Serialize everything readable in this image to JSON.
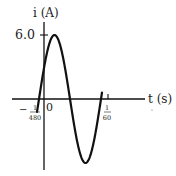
{
  "chart_data": {
    "type": "line",
    "title": "",
    "xlabel": "t (s)",
    "ylabel": "i (A)",
    "function": "i(t) = 6.0 sin(120π (t + 1/480))",
    "amplitude": 6.0,
    "period": "1/60",
    "x_tick_labels": [
      "-1/480",
      "0",
      "1/60"
    ],
    "y_tick_labels": [
      "6.0"
    ],
    "series": [
      {
        "name": "i(t)",
        "x": [
          "-1/480",
          "1/480",
          "3/160",
          "7/480",
          "1/120 + 1/480 ... ",
          "1/60 - 1/480"
        ],
        "points": [
          {
            "t": "-1/480",
            "i": 0
          },
          {
            "t": "1/480",
            "i": 6.0
          },
          {
            "t": "1/160",
            "i": 0
          },
          {
            "t": "1/96",
            "i": -6.0
          },
          {
            "t": "7/480",
            "i": 0
          }
        ]
      }
    ],
    "xlim": [
      "-1/480",
      "1/60"
    ],
    "ylim": [
      -6.0,
      6.0
    ],
    "grid": false,
    "legend": "none"
  },
  "labels": {
    "y_axis": "i (A)",
    "x_axis": "t (s)",
    "y_tick": "6.0",
    "origin": "0",
    "neg_tick_sign": "−",
    "neg_tick_num": "1",
    "neg_tick_den": "480",
    "pos_tick_num": "1",
    "pos_tick_den": "60"
  },
  "colors": {
    "curve": "#111111",
    "axes": "#111111",
    "text": "#222222",
    "background": "#ffffff"
  }
}
